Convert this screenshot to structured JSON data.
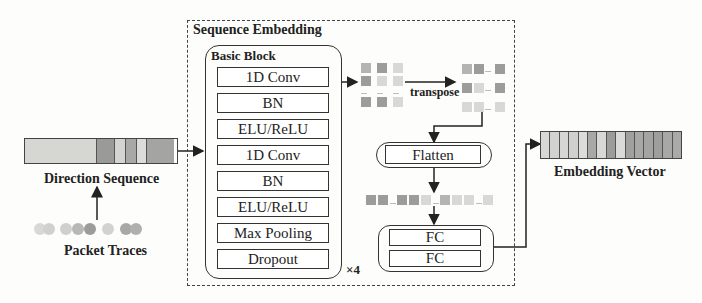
{
  "input": {
    "direction_sequence_label": "Direction Sequence",
    "packet_traces_label": "Packet Traces",
    "direction_cells": [
      {
        "w": 72,
        "color": "#d6d6d2"
      },
      {
        "w": 18,
        "color": "#9a9a98"
      },
      {
        "w": 11,
        "color": "#d4d4d0"
      },
      {
        "w": 11,
        "color": "#a8a8a6"
      },
      {
        "w": 10,
        "color": "#dcdcd8"
      },
      {
        "w": 27,
        "color": "#a4a4a2"
      }
    ],
    "packet_dots": [
      "#d8d8d4",
      "#d0d0cc",
      "#cfcfcb",
      "#b8b8b4",
      "#9c9c9a",
      "#d2d2ce",
      "#a8a8a6",
      "#b0b0ac"
    ]
  },
  "sequence_embedding": {
    "title": "Sequence Embedding",
    "basic_block": {
      "title": "Basic Block",
      "layers": [
        "1D Conv",
        "BN",
        "ELU/ReLU",
        "1D Conv",
        "BN",
        "ELU/ReLU",
        "Max Pooling",
        "Dropout"
      ],
      "repeat": "×4"
    },
    "transpose_label": "transpose",
    "ellipsis": "...",
    "flatten_label": "Flatten",
    "fc_layers": [
      "FC",
      "FC"
    ]
  },
  "output": {
    "label": "Embedding Vector",
    "cells": [
      "#d8d8d4",
      "#d2d2ce",
      "#d6d6d2",
      "#d0d0cc",
      "#dcdcd8",
      "#a8a8a6",
      "#d8d8d4",
      "#9c9c9a",
      "#dadad6",
      "#a0a09e",
      "#a8a8a6",
      "#a4a4a2",
      "#9e9e9c",
      "#a8a8a6",
      "#aaaaa8"
    ]
  },
  "colors": {
    "line": "#333333",
    "dark_cell": "#9c9c9a",
    "mid_cell": "#b4b4b0",
    "light_cell": "#d8d8d4"
  }
}
